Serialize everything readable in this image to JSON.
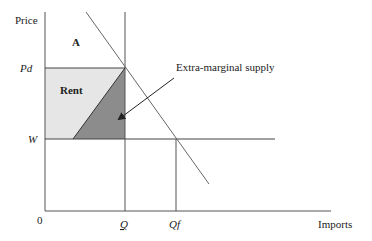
{
  "diagram": {
    "axes": {
      "y_label": "Price",
      "x_label": "Imports",
      "origin": "0"
    },
    "price_levels": {
      "domestic": "Pd",
      "world": "W"
    },
    "quantity_levels": {
      "quota": "Q",
      "free_trade": "Qf"
    },
    "regions": {
      "area_a": "A",
      "rent": "Rent"
    },
    "annotations": {
      "extra_marginal": "Extra-marginal supply"
    },
    "colors": {
      "rent_fill": "#e6e6e6",
      "extra_marginal_fill": "#8c8c8c",
      "line": "#555555"
    }
  }
}
